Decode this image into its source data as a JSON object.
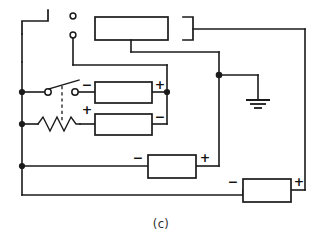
{
  "figure": {
    "caption": "(c)",
    "background_color": "#ffffff",
    "line_color": "#1a1a1a"
  },
  "brackets": {
    "left_label": "left-bracket",
    "right_label": "right-bracket"
  },
  "terminals": {
    "upper_label": "terminal-upper",
    "lower_label": "terminal-lower"
  },
  "boxes": {
    "top": {
      "name": "top-block",
      "left_sign": "",
      "right_sign": ""
    },
    "upper": {
      "name": "upper-block",
      "left_sign": "−",
      "right_sign": "+"
    },
    "middle": {
      "name": "middle-block",
      "left_sign": "+",
      "right_sign": "−"
    },
    "lower": {
      "name": "lower-block",
      "left_sign": "−",
      "right_sign": "+"
    },
    "bottom": {
      "name": "bottom-block",
      "left_sign": "−",
      "right_sign": "+"
    }
  },
  "components": {
    "switch": "switch-contacts",
    "resistor": "variable-resistor",
    "ganged_link": "dashed-ganged-link",
    "ground": "ground-symbol"
  }
}
